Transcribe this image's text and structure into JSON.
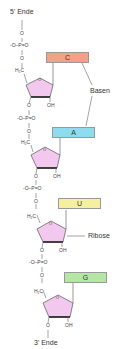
{
  "labels": {
    "five_prime": "5' Ende",
    "three_prime": "3' Ende",
    "bases_label": "Basen",
    "ribose_label": "Ribose"
  },
  "chem": {
    "o": "O",
    "phosphate": "O–P=O",
    "phosphate_charge": "-",
    "h2c": "H₂C",
    "oh": "OH"
  },
  "bases": [
    {
      "letter": "C",
      "color": "#f4a08a"
    },
    {
      "letter": "A",
      "color": "#8fdcef"
    },
    {
      "letter": "U",
      "color": "#f5f0a0"
    },
    {
      "letter": "G",
      "color": "#b6e6a6"
    }
  ],
  "ribose_color": "#f2c8ee"
}
